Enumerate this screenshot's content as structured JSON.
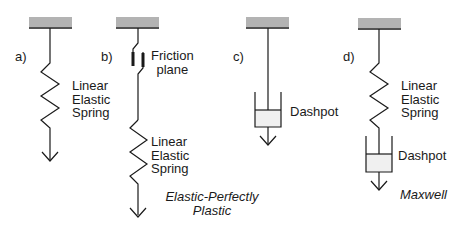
{
  "diagram": {
    "colors": {
      "ceiling": "#b3b3b3",
      "line": "#1a1a1a",
      "dashpot_fill": "#f0f0f0"
    },
    "panels": [
      {
        "id": "a",
        "label": "a)",
        "elements": [
          "ceiling",
          "linear-elastic-spring",
          "arrow"
        ],
        "spring_label": [
          "Linear",
          "Elastic",
          "Spring"
        ]
      },
      {
        "id": "b",
        "label": "b)",
        "elements": [
          "ceiling",
          "friction-plane",
          "linear-elastic-spring",
          "arrow"
        ],
        "friction_label": [
          "Friction",
          "plane"
        ],
        "spring_label": [
          "Linear",
          "Elastic",
          "Spring"
        ],
        "model_name": [
          "Elastic-Perfectly",
          "Plastic"
        ]
      },
      {
        "id": "c",
        "label": "c)",
        "elements": [
          "ceiling",
          "dashpot",
          "arrow"
        ],
        "dashpot_label": "Dashpot"
      },
      {
        "id": "d",
        "label": "d)",
        "elements": [
          "ceiling",
          "linear-elastic-spring",
          "dashpot",
          "arrow"
        ],
        "spring_label": [
          "Linear",
          "Elastic",
          "Spring"
        ],
        "dashpot_label": "Dashpot",
        "model_name": "Maxwell"
      }
    ]
  }
}
